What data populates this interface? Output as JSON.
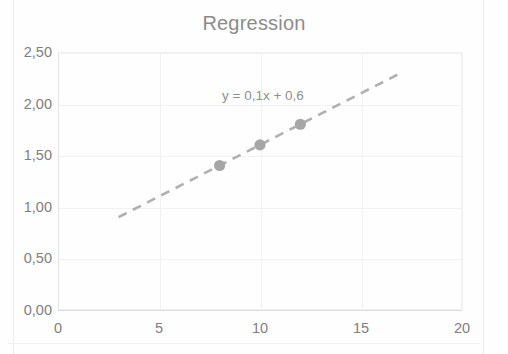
{
  "chart_data": {
    "type": "scatter",
    "title": "Regression",
    "xlabel": "",
    "ylabel": "",
    "xlim": [
      0,
      20
    ],
    "ylim": [
      0,
      2.5
    ],
    "grid": true,
    "legend": "none",
    "decimal_separator": ",",
    "x_ticks": [
      "0",
      "5",
      "10",
      "15",
      "20"
    ],
    "x_tick_values": [
      0,
      5,
      10,
      15,
      20
    ],
    "y_ticks": [
      "0,00",
      "0,50",
      "1,00",
      "1,50",
      "2,00",
      "2,50"
    ],
    "y_tick_values": [
      0,
      0.5,
      1.0,
      1.5,
      2.0,
      2.5
    ],
    "series": [
      {
        "name": "data-points",
        "marker": "circle",
        "color": "#a6a6a6",
        "x": [
          8,
          10,
          12
        ],
        "y": [
          1.4,
          1.6,
          1.8
        ],
        "points": [
          {
            "x": 8,
            "y": 1.4
          },
          {
            "x": 10,
            "y": 1.6
          },
          {
            "x": 12,
            "y": 1.8
          }
        ]
      }
    ],
    "trendline": {
      "name": "linear-trendline",
      "style": "dashed",
      "color": "#b0b0b0",
      "slope": 0.1,
      "intercept": 0.6,
      "x_start": 3,
      "x_end": 17,
      "y_start": 0.9,
      "y_end": 2.3,
      "equation": "y = 0,1x + 0,6"
    },
    "annotations": [
      {
        "text": "y = 0,1x + 0,6",
        "x": 8.3,
        "y": 2.15
      }
    ]
  },
  "colors": {
    "title": "#8c8c8c",
    "tick_label": "#7f7f7f",
    "gridline": "#f1f1f1",
    "marker": "#a6a6a6",
    "trendline": "#b0b0b0",
    "background": "#fefefe"
  }
}
